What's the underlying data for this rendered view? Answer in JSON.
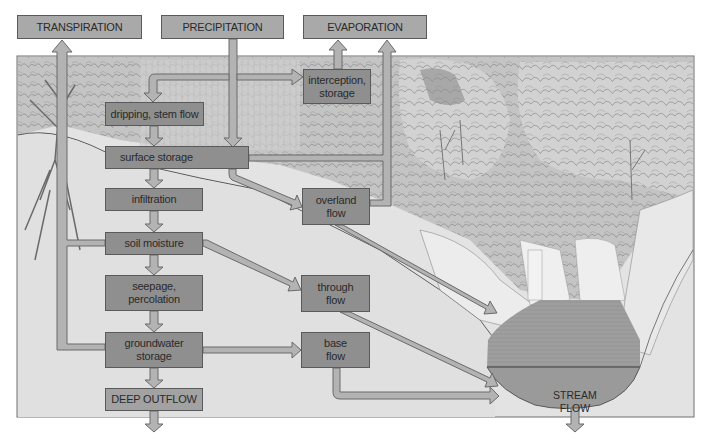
{
  "diagram": {
    "colors": {
      "box_fill": "#8f8f8f",
      "top_box_fill": "#a9a9a9",
      "arrow_fill": "#b3b3b3",
      "arrow_stroke": "#6a6a6a",
      "frame_stroke": "#6e6e6e",
      "ground": "#dcdcdc",
      "vegetation": "#b8b8b8",
      "water": "#9a9a9a"
    },
    "nodes": {
      "transpiration": "TRANSPIRATION",
      "precipitation": "PRECIPITATION",
      "evaporation": "EVAPORATION",
      "interception_storage": "interception,\nstorage",
      "dripping_stem_flow": "dripping, stem flow",
      "surface_storage": "surface storage",
      "infiltration": "infiltration",
      "overland_flow": "overland\nflow",
      "soil_moisture": "soil moisture",
      "seepage_percolation": "seepage,\npercolation",
      "through_flow": "through\nflow",
      "groundwater_storage": "groundwater\nstorage",
      "base_flow": "base\nflow",
      "deep_outflow": "DEEP OUTFLOW",
      "stream_flow": "STREAM\nFLOW"
    },
    "edges": [
      {
        "from": "precipitation",
        "to": "interception_storage"
      },
      {
        "from": "precipitation",
        "to": "dripping_stem_flow"
      },
      {
        "from": "precipitation",
        "to": "surface_storage"
      },
      {
        "from": "interception_storage",
        "to": "evaporation"
      },
      {
        "from": "dripping_stem_flow",
        "to": "surface_storage"
      },
      {
        "from": "surface_storage",
        "to": "evaporation"
      },
      {
        "from": "surface_storage",
        "to": "infiltration"
      },
      {
        "from": "surface_storage",
        "to": "overland_flow"
      },
      {
        "from": "overland_flow",
        "to": "evaporation"
      },
      {
        "from": "overland_flow",
        "to": "stream_flow"
      },
      {
        "from": "infiltration",
        "to": "soil_moisture"
      },
      {
        "from": "soil_moisture",
        "to": "transpiration"
      },
      {
        "from": "soil_moisture",
        "to": "seepage_percolation"
      },
      {
        "from": "soil_moisture",
        "to": "through_flow"
      },
      {
        "from": "seepage_percolation",
        "to": "groundwater_storage"
      },
      {
        "from": "through_flow",
        "to": "stream_flow"
      },
      {
        "from": "groundwater_storage",
        "to": "transpiration"
      },
      {
        "from": "groundwater_storage",
        "to": "base_flow"
      },
      {
        "from": "groundwater_storage",
        "to": "deep_outflow"
      },
      {
        "from": "base_flow",
        "to": "stream_flow"
      },
      {
        "from": "deep_outflow",
        "to": "out"
      },
      {
        "from": "stream_flow",
        "to": "out"
      }
    ]
  }
}
